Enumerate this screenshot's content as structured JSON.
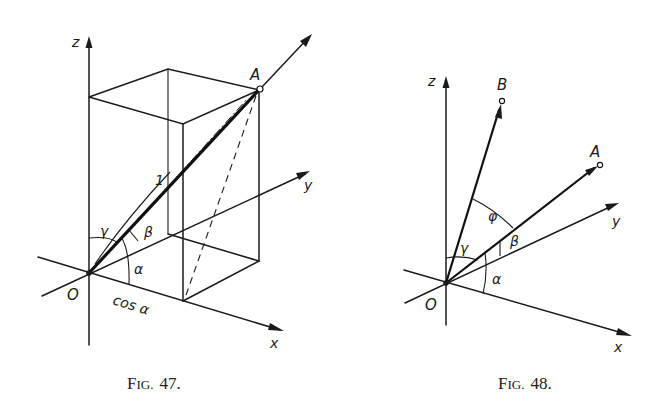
{
  "figures": [
    {
      "caption": "Fig. 47.",
      "caption_prefix": "F",
      "caption_sc": "IG.",
      "caption_num": "47.",
      "axes": {
        "x": "x",
        "y": "y",
        "z": "z"
      },
      "origin_label": "O",
      "point_label": "A",
      "unit_label": "1",
      "angle_labels": {
        "alpha": "α",
        "beta": "β",
        "gamma": "γ"
      },
      "projection_label": "cos α",
      "description": "Unit vector OA inside a rectangular box with direction angles α, β, γ to the x, y, z axes; projection on x axis equals cos α"
    },
    {
      "caption": "Fig. 48.",
      "caption_prefix": "F",
      "caption_sc": "IG.",
      "caption_num": "48.",
      "axes": {
        "x": "x",
        "y": "y",
        "z": "z"
      },
      "origin_label": "O",
      "point_labels": [
        "A",
        "B"
      ],
      "angle_labels": {
        "alpha": "α",
        "beta": "β",
        "gamma": "γ",
        "phi": "φ"
      },
      "description": "Two vectors OA and OB from origin O with angle φ between them; direction angles α, β, γ shown"
    }
  ]
}
